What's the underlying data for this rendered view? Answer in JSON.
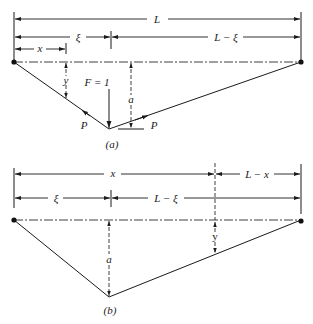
{
  "figure": {
    "panel_a": {
      "caption": "(a)",
      "dimensions": {
        "span_total": "L",
        "left_segment": "ξ",
        "right_segment": "L − ξ",
        "small_segment": "x"
      },
      "deflection_label": "y",
      "load_label": "F = 1",
      "sag_label": "a",
      "tension_left": "P",
      "tension_right": "P"
    },
    "panel_b": {
      "caption": "(b)",
      "dimensions": {
        "span_x": "x",
        "right_remainder": "L − x",
        "left_segment": "ξ",
        "right_segment": "L − ξ"
      },
      "sag_label": "a",
      "deflection_label": "y"
    }
  }
}
